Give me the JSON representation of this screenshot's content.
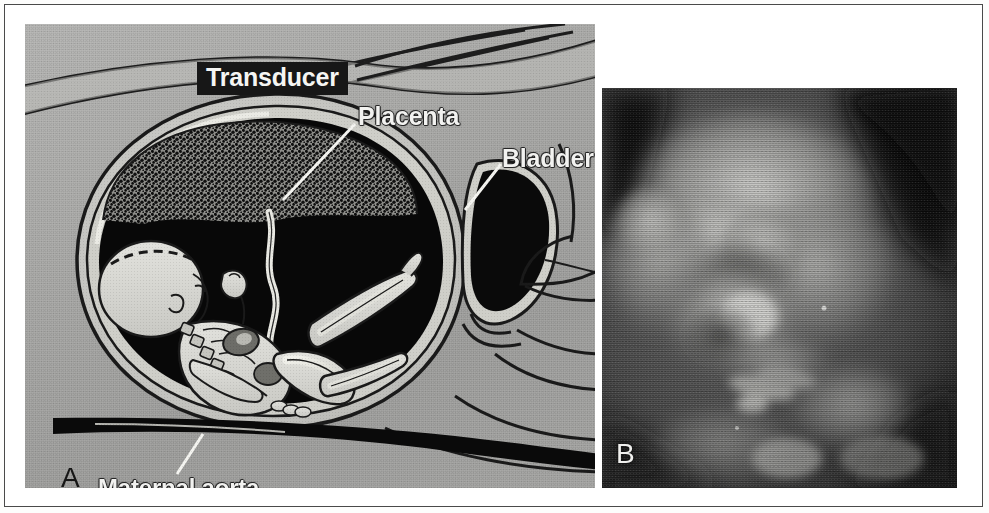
{
  "figure": {
    "type": "two-panel medical figure",
    "background_color": "#ffffff",
    "border_color": "#4a4a4a"
  },
  "panel_a": {
    "id": "A",
    "caption_letter": "A",
    "description": "Line-drawing cross section of a pregnant abdomen showing the ultrasound transducer on the maternal abdominal wall, the placenta, the fetus within the uterus, the maternal bladder and the maternal aorta.",
    "background_color": "#a9a9a7",
    "labels": [
      {
        "id": "transducer",
        "text": "Transducer",
        "style": "white text on black box",
        "text_color": "#f5f5f3",
        "box_color": "#171717"
      },
      {
        "id": "placenta",
        "text": "Placenta",
        "style": "white outlined text with leader line",
        "text_color": "#f2f2f0"
      },
      {
        "id": "bladder",
        "text": "Bladder",
        "style": "white outlined text with leader line",
        "text_color": "#f2f2f0"
      },
      {
        "id": "maternal_aorta",
        "text": "Maternal aorta",
        "style": "white outlined text with leader line",
        "text_color": "#f2f2f0"
      }
    ]
  },
  "panel_b": {
    "id": "B",
    "caption_letter": "B",
    "description": "Grayscale three-dimensional surface-rendered ultrasound image of a fetal face with the hand in front of the face.",
    "background_color": "#1b1b1b",
    "caption_color": "#f0f0ee"
  }
}
